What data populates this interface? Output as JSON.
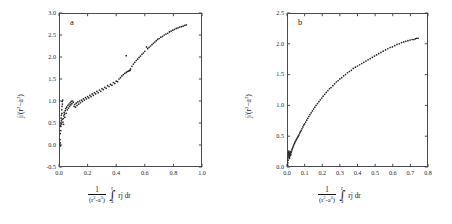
{
  "figure": {
    "panels": [
      {
        "id": "a",
        "letter": "a",
        "y_title": "j/(r²−a²)",
        "x_title_numerator": "1",
        "x_title_denominator": "(r²-a²)",
        "x_title_integral_upper": "r",
        "x_title_integral_lower": "a",
        "x_title_integrand": "rj dr",
        "y_ticks": [
          "-0.5",
          "0.0",
          "0.5",
          "1.0",
          "1.5",
          "2.0",
          "2.5",
          "3.0"
        ],
        "x_ticks": [
          "0.0",
          "0.2",
          "0.4",
          "0.6",
          "0.8",
          "1.0"
        ]
      },
      {
        "id": "b",
        "letter": "b",
        "y_title": "j/(r²−a²)",
        "x_title_numerator": "1",
        "x_title_denominator": "(r²-a²)",
        "x_title_integral_upper": "r",
        "x_title_integral_lower": "a",
        "x_title_integrand": "rj dr",
        "y_ticks": [
          "0.0",
          "0.5",
          "1.0",
          "1.5",
          "2.0",
          "2.5"
        ],
        "x_ticks": [
          "0.0",
          "0.1",
          "0.2",
          "0.3",
          "0.4",
          "0.5",
          "0.6",
          "0.7",
          "0.8"
        ]
      }
    ]
  },
  "chart_data": [
    {
      "type": "scatter",
      "title": "a",
      "xlabel": "1/(r²-a²) ∫ₐʳ rj dr",
      "ylabel": "j/(r²−a²)",
      "xlim": [
        0.0,
        1.0
      ],
      "ylim": [
        -0.5,
        3.0
      ],
      "xticks": [
        0.0,
        0.2,
        0.4,
        0.6,
        0.8,
        1.0
      ],
      "yticks": [
        -0.5,
        0.0,
        0.5,
        1.0,
        1.5,
        2.0,
        2.5,
        3.0
      ],
      "grid": false,
      "legend": null,
      "marker": "dot",
      "points": [
        [
          0.006,
          0.02
        ],
        [
          0.008,
          0.05
        ],
        [
          0.007,
          0.12
        ],
        [
          0.01,
          -0.02
        ],
        [
          0.009,
          0.26
        ],
        [
          0.012,
          0.33
        ],
        [
          0.011,
          0.45
        ],
        [
          0.014,
          0.5
        ],
        [
          0.013,
          0.42
        ],
        [
          0.016,
          0.55
        ],
        [
          0.015,
          0.61
        ],
        [
          0.018,
          0.48
        ],
        [
          0.017,
          0.68
        ],
        [
          0.02,
          0.72
        ],
        [
          0.019,
          0.8
        ],
        [
          0.022,
          0.58
        ],
        [
          0.021,
          0.88
        ],
        [
          0.024,
          0.93
        ],
        [
          0.023,
          0.99
        ],
        [
          0.026,
          1.02
        ],
        [
          0.028,
          0.52
        ],
        [
          0.03,
          0.6
        ],
        [
          0.032,
          0.47
        ],
        [
          0.034,
          0.66
        ],
        [
          0.036,
          0.74
        ],
        [
          0.038,
          0.7
        ],
        [
          0.041,
          0.63
        ],
        [
          0.044,
          0.78
        ],
        [
          0.047,
          0.83
        ],
        [
          0.05,
          0.72
        ],
        [
          0.054,
          0.86
        ],
        [
          0.058,
          0.8
        ],
        [
          0.062,
          0.9
        ],
        [
          0.066,
          0.84
        ],
        [
          0.07,
          0.93
        ],
        [
          0.074,
          0.88
        ],
        [
          0.078,
          0.96
        ],
        [
          0.082,
          0.91
        ],
        [
          0.086,
          0.99
        ],
        [
          0.09,
          0.94
        ],
        [
          0.095,
          1.0
        ],
        [
          0.1,
          0.97
        ],
        [
          0.105,
          0.88
        ],
        [
          0.11,
          0.92
        ],
        [
          0.115,
          0.86
        ],
        [
          0.12,
          0.95
        ],
        [
          0.126,
          0.9
        ],
        [
          0.132,
          0.98
        ],
        [
          0.138,
          0.93
        ],
        [
          0.144,
          1.0
        ],
        [
          0.15,
          0.96
        ],
        [
          0.157,
          1.02
        ],
        [
          0.164,
          0.99
        ],
        [
          0.171,
          1.05
        ],
        [
          0.178,
          1.02
        ],
        [
          0.185,
          1.08
        ],
        [
          0.192,
          1.05
        ],
        [
          0.2,
          1.1
        ],
        [
          0.208,
          1.07
        ],
        [
          0.216,
          1.13
        ],
        [
          0.224,
          1.1
        ],
        [
          0.232,
          1.16
        ],
        [
          0.24,
          1.13
        ],
        [
          0.248,
          1.19
        ],
        [
          0.256,
          1.16
        ],
        [
          0.265,
          1.22
        ],
        [
          0.274,
          1.19
        ],
        [
          0.283,
          1.25
        ],
        [
          0.292,
          1.22
        ],
        [
          0.301,
          1.28
        ],
        [
          0.31,
          1.26
        ],
        [
          0.32,
          1.31
        ],
        [
          0.33,
          1.29
        ],
        [
          0.34,
          1.35
        ],
        [
          0.35,
          1.33
        ],
        [
          0.36,
          1.38
        ],
        [
          0.37,
          1.36
        ],
        [
          0.38,
          1.42
        ],
        [
          0.39,
          1.4
        ],
        [
          0.4,
          1.45
        ],
        [
          0.41,
          1.44
        ],
        [
          0.42,
          1.5
        ],
        [
          0.43,
          1.53
        ],
        [
          0.44,
          1.57
        ],
        [
          0.45,
          1.6
        ],
        [
          0.46,
          1.63
        ],
        [
          0.47,
          1.65
        ],
        [
          0.478,
          1.67
        ],
        [
          0.486,
          1.68
        ],
        [
          0.492,
          1.69
        ],
        [
          0.498,
          1.7
        ],
        [
          0.47,
          2.03
        ],
        [
          0.5,
          1.73
        ],
        [
          0.51,
          1.79
        ],
        [
          0.52,
          1.84
        ],
        [
          0.53,
          1.88
        ],
        [
          0.54,
          1.92
        ],
        [
          0.55,
          1.95
        ],
        [
          0.56,
          1.99
        ],
        [
          0.57,
          2.02
        ],
        [
          0.58,
          2.06
        ],
        [
          0.59,
          2.09
        ],
        [
          0.6,
          2.13
        ],
        [
          0.612,
          2.23
        ],
        [
          0.62,
          2.19
        ],
        [
          0.63,
          2.22
        ],
        [
          0.64,
          2.25
        ],
        [
          0.65,
          2.28
        ],
        [
          0.66,
          2.31
        ],
        [
          0.67,
          2.34
        ],
        [
          0.68,
          2.37
        ],
        [
          0.69,
          2.4
        ],
        [
          0.7,
          2.42
        ],
        [
          0.712,
          2.45
        ],
        [
          0.724,
          2.47
        ],
        [
          0.736,
          2.5
        ],
        [
          0.748,
          2.52
        ],
        [
          0.76,
          2.54
        ],
        [
          0.772,
          2.57
        ],
        [
          0.784,
          2.59
        ],
        [
          0.796,
          2.61
        ],
        [
          0.808,
          2.63
        ],
        [
          0.82,
          2.65
        ],
        [
          0.832,
          2.66
        ],
        [
          0.844,
          2.68
        ],
        [
          0.856,
          2.69
        ],
        [
          0.868,
          2.7
        ],
        [
          0.88,
          2.72
        ],
        [
          0.89,
          2.73
        ]
      ]
    },
    {
      "type": "scatter",
      "title": "b",
      "xlabel": "1/(r²-a²) ∫ₐʳ rj dr",
      "ylabel": "j/(r²−a²)",
      "xlim": [
        0.0,
        0.8
      ],
      "ylim": [
        0.0,
        2.5
      ],
      "xticks": [
        0.0,
        0.1,
        0.2,
        0.3,
        0.4,
        0.5,
        0.6,
        0.7,
        0.8
      ],
      "yticks": [
        0.0,
        0.5,
        1.0,
        1.5,
        2.0,
        2.5
      ],
      "grid": false,
      "legend": null,
      "marker": "dot",
      "points": [
        [
          0.004,
          0.03
        ],
        [
          0.005,
          0.07
        ],
        [
          0.006,
          0.11
        ],
        [
          0.006,
          0.15
        ],
        [
          0.007,
          0.18
        ],
        [
          0.008,
          0.21
        ],
        [
          0.009,
          0.24
        ],
        [
          0.01,
          0.26
        ],
        [
          0.011,
          0.22
        ],
        [
          0.012,
          0.19
        ],
        [
          0.013,
          0.16
        ],
        [
          0.014,
          0.14
        ],
        [
          0.015,
          0.17
        ],
        [
          0.016,
          0.2
        ],
        [
          0.017,
          0.23
        ],
        [
          0.018,
          0.25
        ],
        [
          0.019,
          0.22
        ],
        [
          0.02,
          0.19
        ],
        [
          0.022,
          0.21
        ],
        [
          0.024,
          0.24
        ],
        [
          0.026,
          0.26
        ],
        [
          0.028,
          0.28
        ],
        [
          0.03,
          0.3
        ],
        [
          0.033,
          0.32
        ],
        [
          0.036,
          0.34
        ],
        [
          0.039,
          0.36
        ],
        [
          0.042,
          0.38
        ],
        [
          0.045,
          0.4
        ],
        [
          0.048,
          0.42
        ],
        [
          0.052,
          0.44
        ],
        [
          0.056,
          0.46
        ],
        [
          0.06,
          0.48
        ],
        [
          0.064,
          0.5
        ],
        [
          0.068,
          0.52
        ],
        [
          0.072,
          0.55
        ],
        [
          0.076,
          0.57
        ],
        [
          0.08,
          0.59
        ],
        [
          0.085,
          0.62
        ],
        [
          0.09,
          0.65
        ],
        [
          0.095,
          0.68
        ],
        [
          0.1,
          0.7
        ],
        [
          0.106,
          0.73
        ],
        [
          0.112,
          0.76
        ],
        [
          0.118,
          0.79
        ],
        [
          0.124,
          0.82
        ],
        [
          0.13,
          0.85
        ],
        [
          0.137,
          0.88
        ],
        [
          0.144,
          0.91
        ],
        [
          0.151,
          0.94
        ],
        [
          0.158,
          0.97
        ],
        [
          0.165,
          1.0
        ],
        [
          0.173,
          1.03
        ],
        [
          0.181,
          1.06
        ],
        [
          0.189,
          1.09
        ],
        [
          0.197,
          1.12
        ],
        [
          0.205,
          1.15
        ],
        [
          0.214,
          1.18
        ],
        [
          0.223,
          1.21
        ],
        [
          0.232,
          1.24
        ],
        [
          0.241,
          1.27
        ],
        [
          0.25,
          1.29
        ],
        [
          0.26,
          1.32
        ],
        [
          0.27,
          1.35
        ],
        [
          0.28,
          1.38
        ],
        [
          0.29,
          1.4
        ],
        [
          0.3,
          1.43
        ],
        [
          0.31,
          1.45
        ],
        [
          0.321,
          1.48
        ],
        [
          0.332,
          1.5
        ],
        [
          0.343,
          1.53
        ],
        [
          0.354,
          1.55
        ],
        [
          0.365,
          1.57
        ],
        [
          0.376,
          1.6
        ],
        [
          0.388,
          1.62
        ],
        [
          0.4,
          1.64
        ],
        [
          0.412,
          1.66
        ],
        [
          0.424,
          1.68
        ],
        [
          0.436,
          1.7
        ],
        [
          0.448,
          1.72
        ],
        [
          0.46,
          1.74
        ],
        [
          0.472,
          1.76
        ],
        [
          0.484,
          1.78
        ],
        [
          0.496,
          1.8
        ],
        [
          0.508,
          1.82
        ],
        [
          0.52,
          1.84
        ],
        [
          0.533,
          1.86
        ],
        [
          0.546,
          1.88
        ],
        [
          0.559,
          1.9
        ],
        [
          0.572,
          1.92
        ],
        [
          0.585,
          1.94
        ],
        [
          0.598,
          1.95
        ],
        [
          0.611,
          1.97
        ],
        [
          0.624,
          1.99
        ],
        [
          0.637,
          2.0
        ],
        [
          0.65,
          2.02
        ],
        [
          0.662,
          2.03
        ],
        [
          0.674,
          2.04
        ],
        [
          0.686,
          2.05
        ],
        [
          0.698,
          2.06
        ],
        [
          0.71,
          2.07
        ],
        [
          0.72,
          2.07
        ],
        [
          0.728,
          2.08
        ],
        [
          0.736,
          2.09
        ],
        [
          0.744,
          2.09
        ]
      ]
    }
  ]
}
